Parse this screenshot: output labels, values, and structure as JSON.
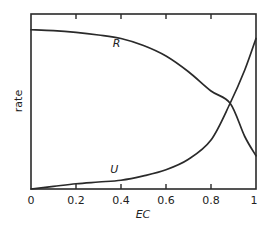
{
  "chart_data": {
    "type": "line",
    "title": "",
    "xlabel": "EC",
    "ylabel": "rate",
    "xlim": [
      0,
      1
    ],
    "ylim": [
      0,
      1
    ],
    "grid": false,
    "legend": "inline labels on curves",
    "x_ticks": [
      0,
      0.2,
      0.4,
      0.6,
      0.8,
      1
    ],
    "x_tick_labels": [
      "0",
      "0.2",
      "0.4",
      "0.6",
      "0.8",
      "1"
    ],
    "y_ticks": [],
    "series": [
      {
        "name": "R",
        "label_position": {
          "x": 0.38,
          "y": 0.81
        },
        "x": [
          0,
          0.1,
          0.2,
          0.3,
          0.4,
          0.5,
          0.6,
          0.7,
          0.8,
          0.885,
          0.95,
          1.0
        ],
        "values": [
          0.91,
          0.905,
          0.895,
          0.88,
          0.86,
          0.82,
          0.76,
          0.67,
          0.56,
          0.49,
          0.3,
          0.19
        ]
      },
      {
        "name": "U",
        "label_position": {
          "x": 0.37,
          "y": 0.09
        },
        "x": [
          0,
          0.1,
          0.2,
          0.3,
          0.4,
          0.5,
          0.6,
          0.7,
          0.8,
          0.885,
          0.95,
          1.0
        ],
        "values": [
          0.0,
          0.015,
          0.03,
          0.04,
          0.05,
          0.075,
          0.11,
          0.17,
          0.28,
          0.49,
          0.68,
          0.86
        ]
      }
    ],
    "annotations": [
      "R and U curves intersect near EC ≈ 0.885, rate ≈ 0.49"
    ]
  },
  "plot": {
    "left": 31,
    "right": 256,
    "top": 14,
    "bottom": 189
  }
}
